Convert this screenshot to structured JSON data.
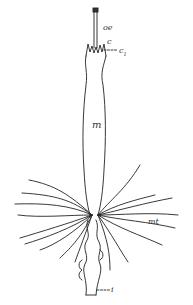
{
  "figure": {
    "stroke_color": "#222222",
    "background": "#ffffff",
    "labels": {
      "oe": "oe",
      "c": "c",
      "c1": "c",
      "c1_sub": "1",
      "m": "m",
      "mt": "mt",
      "i": "i"
    }
  }
}
